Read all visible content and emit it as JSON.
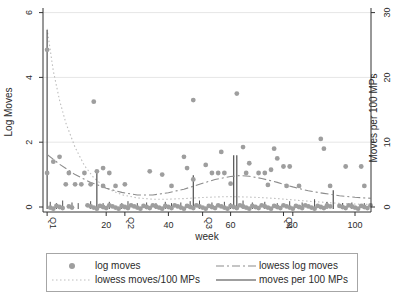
{
  "chart_data": {
    "type": "composite",
    "title": "",
    "xlabel": "week",
    "ylabel_left": "Log Moves",
    "ylabel_right": "Moves per 100 MPs",
    "x_axis": {
      "range": [
        0,
        106
      ],
      "ticks": [
        20,
        40,
        60,
        80,
        100
      ],
      "quarter_ticks": [
        {
          "label": "Q1",
          "week": 1
        },
        {
          "label": "Q2",
          "week": 26
        },
        {
          "label": "Q3",
          "week": 51
        },
        {
          "label": "Q4",
          "week": 77
        }
      ]
    },
    "y_axis_left": {
      "range": [
        0,
        6.2
      ],
      "ticks": [
        0,
        2,
        4,
        6
      ],
      "grid_at": [
        2,
        4,
        6
      ]
    },
    "y_axis_right": {
      "range": [
        0,
        31
      ],
      "ticks": [
        0,
        10,
        20,
        30
      ]
    },
    "series": [
      {
        "name": "log moves",
        "type": "scatter",
        "axis": "left",
        "points": [
          [
            1,
            4.85
          ],
          [
            1,
            1.05
          ],
          [
            3,
            1.4
          ],
          [
            5,
            1.55
          ],
          [
            7,
            0.7
          ],
          [
            8,
            1.05
          ],
          [
            10,
            0.7
          ],
          [
            12,
            0.7
          ],
          [
            13,
            1.05
          ],
          [
            15,
            0.7
          ],
          [
            16,
            3.25
          ],
          [
            17,
            1.1
          ],
          [
            19,
            0.65
          ],
          [
            19,
            1.2
          ],
          [
            21,
            1.05
          ],
          [
            23,
            0.65
          ],
          [
            26,
            0.7
          ],
          [
            34,
            1.1
          ],
          [
            38,
            1.0
          ],
          [
            41,
            0.65
          ],
          [
            45,
            1.55
          ],
          [
            46,
            1.2
          ],
          [
            48,
            3.3
          ],
          [
            48,
            0.85
          ],
          [
            52,
            1.3
          ],
          [
            54,
            1.05
          ],
          [
            56,
            1.05
          ],
          [
            57,
            1.7
          ],
          [
            58,
            1.05
          ],
          [
            60,
            0.72
          ],
          [
            62,
            3.5
          ],
          [
            64,
            1.85
          ],
          [
            65,
            1.05
          ],
          [
            66,
            1.35
          ],
          [
            69,
            1.05
          ],
          [
            71,
            1.05
          ],
          [
            72,
            0.68
          ],
          [
            73,
            1.15
          ],
          [
            74,
            1.8
          ],
          [
            75,
            1.5
          ],
          [
            77,
            1.25
          ],
          [
            78,
            0.65
          ],
          [
            79,
            1.25
          ],
          [
            82,
            0.65
          ],
          [
            89,
            2.1
          ],
          [
            90,
            1.8
          ],
          [
            92,
            0.65
          ],
          [
            97,
            1.25
          ],
          [
            102,
            1.25
          ],
          [
            103,
            0.65
          ]
        ],
        "zero_weeks": [
          2,
          3,
          4,
          5,
          6,
          8,
          9,
          14,
          15,
          16,
          17,
          18,
          19,
          20,
          21,
          22,
          23,
          24,
          25,
          26,
          27,
          28,
          29,
          30,
          31,
          32,
          33,
          34,
          35,
          36,
          37,
          38,
          39,
          40,
          41,
          42,
          43,
          44,
          45,
          46,
          47,
          48,
          49,
          50,
          51,
          52,
          53,
          54,
          55,
          56,
          57,
          58,
          59,
          60,
          61,
          62,
          63,
          64,
          65,
          66,
          67,
          68,
          69,
          70,
          71,
          72,
          73,
          74,
          75,
          76,
          77,
          78,
          79,
          80,
          81,
          82,
          83,
          84,
          85,
          86,
          87,
          88,
          89,
          90,
          91,
          92,
          95,
          96,
          97,
          98,
          99,
          100,
          101,
          102,
          103,
          104,
          105
        ]
      },
      {
        "name": "lowess log moves",
        "type": "line",
        "style": "dashdot",
        "axis": "left",
        "points": [
          [
            1,
            1.62
          ],
          [
            5,
            1.32
          ],
          [
            10,
            1.0
          ],
          [
            15,
            0.76
          ],
          [
            20,
            0.58
          ],
          [
            25,
            0.45
          ],
          [
            30,
            0.37
          ],
          [
            35,
            0.37
          ],
          [
            40,
            0.44
          ],
          [
            45,
            0.55
          ],
          [
            50,
            0.7
          ],
          [
            55,
            0.85
          ],
          [
            60,
            0.94
          ],
          [
            63,
            0.97
          ],
          [
            66,
            0.95
          ],
          [
            70,
            0.88
          ],
          [
            75,
            0.76
          ],
          [
            80,
            0.62
          ],
          [
            85,
            0.5
          ],
          [
            90,
            0.42
          ],
          [
            95,
            0.35
          ],
          [
            100,
            0.3
          ],
          [
            105,
            0.27
          ]
        ]
      },
      {
        "name": "lowess moves/100 MPs",
        "type": "line",
        "style": "dotted",
        "axis": "right",
        "points": [
          [
            1,
            27.5
          ],
          [
            3,
            21
          ],
          [
            5,
            16.5
          ],
          [
            7,
            13
          ],
          [
            10,
            9.2
          ],
          [
            13,
            6.4
          ],
          [
            16,
            4.5
          ],
          [
            20,
            2.9
          ],
          [
            25,
            1.9
          ],
          [
            30,
            1.4
          ],
          [
            35,
            1.2
          ],
          [
            40,
            1.2
          ],
          [
            45,
            1.3
          ],
          [
            50,
            1.45
          ],
          [
            55,
            1.55
          ],
          [
            60,
            1.6
          ],
          [
            65,
            1.55
          ],
          [
            70,
            1.45
          ],
          [
            75,
            1.3
          ],
          [
            80,
            1.1
          ],
          [
            85,
            0.9
          ],
          [
            90,
            0.72
          ],
          [
            95,
            0.55
          ],
          [
            100,
            0.45
          ],
          [
            105,
            0.4
          ]
        ]
      },
      {
        "name": "moves per 100 MPs",
        "type": "spike",
        "axis": "right",
        "points": [
          [
            1,
            27.3
          ],
          [
            17,
            5.3
          ],
          [
            48,
            4.9
          ],
          [
            61,
            8.0
          ],
          [
            62,
            8.0
          ],
          [
            93,
            2.6
          ]
        ],
        "minor_spikes": [
          [
            2,
            0.8
          ],
          [
            4,
            0.6
          ],
          [
            6,
            1.0
          ],
          [
            9,
            0.7
          ],
          [
            11,
            0.6
          ],
          [
            15,
            0.9
          ],
          [
            19,
            0.6
          ],
          [
            21,
            0.8
          ],
          [
            25,
            0.6
          ],
          [
            27,
            0.9
          ],
          [
            30,
            0.6
          ],
          [
            33,
            0.7
          ],
          [
            36,
            0.6
          ],
          [
            39,
            0.8
          ],
          [
            41,
            0.6
          ],
          [
            44,
            0.7
          ],
          [
            47,
            0.9
          ],
          [
            50,
            1.0
          ],
          [
            54,
            0.7
          ],
          [
            58,
            0.8
          ],
          [
            60,
            0.6
          ],
          [
            64,
            1.0
          ],
          [
            67,
            0.7
          ],
          [
            71,
            0.8
          ],
          [
            75,
            0.6
          ],
          [
            79,
            0.9
          ],
          [
            83,
            0.7
          ],
          [
            87,
            1.2
          ],
          [
            91,
            0.8
          ],
          [
            96,
            0.6
          ],
          [
            99,
            0.7
          ],
          [
            103,
            0.6
          ]
        ]
      }
    ],
    "legend": {
      "position": "bottom",
      "entries": [
        {
          "label": "log moves",
          "symbol": "dot"
        },
        {
          "label": "lowess log moves",
          "symbol": "dashdot-line"
        },
        {
          "label": "lowess moves/100 MPs",
          "symbol": "dotted-line"
        },
        {
          "label": "moves per 100 MPs",
          "symbol": "solid-line"
        }
      ]
    },
    "colors": {
      "dot": "#9e9e9e",
      "lowess_log": "#8c8c8c",
      "lowess_moves": "#bdbdbd",
      "spike": "#404040",
      "axis": "#333333",
      "grid": "#e6e6e6",
      "text": "#2b2b2b",
      "legend_border": "#a6a6a6",
      "background": "#ffffff"
    }
  }
}
